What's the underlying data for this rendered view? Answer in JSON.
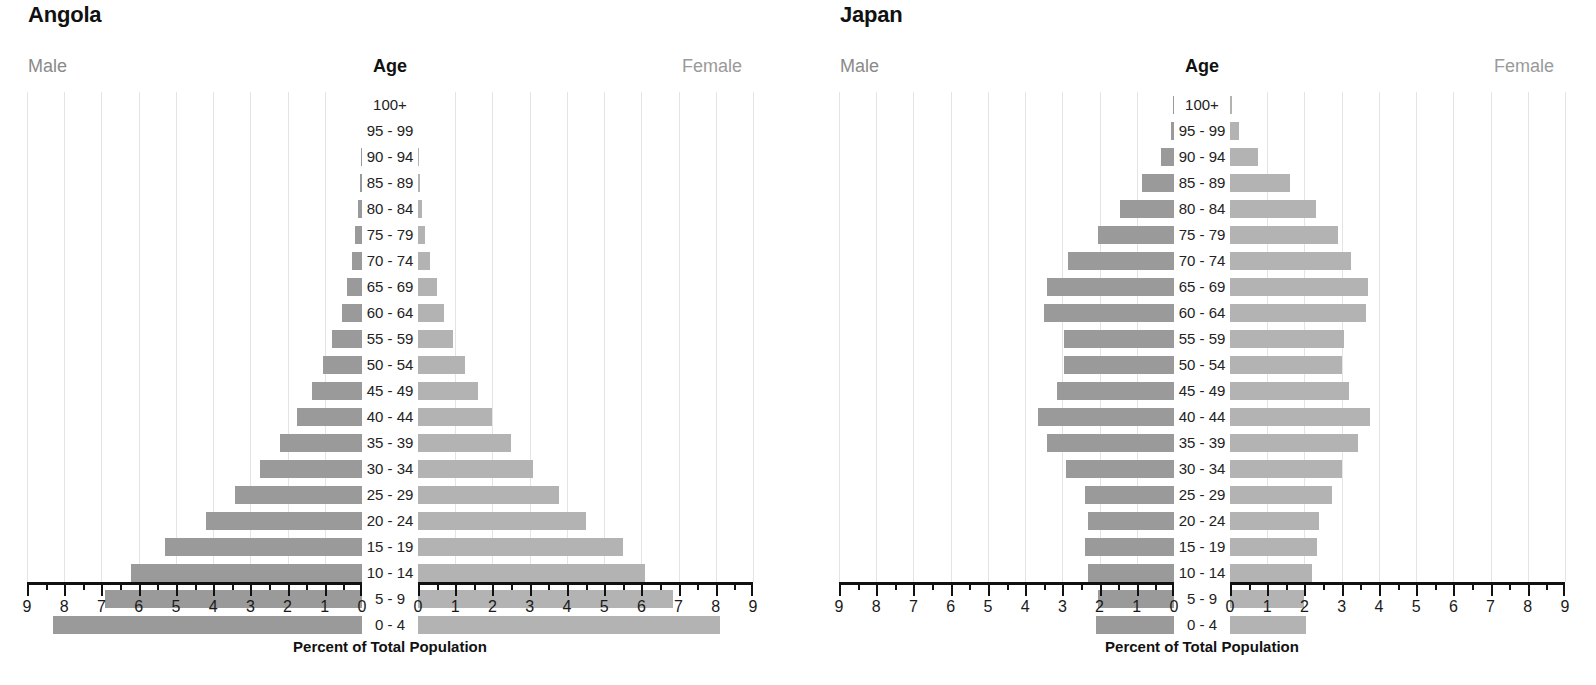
{
  "figure": {
    "axis_caption": "Percent of Total Population",
    "male_label": "Male",
    "female_label": "Female",
    "age_header": "Age",
    "bar_color_male": "#9a9a9a",
    "bar_color_female": "#b3b3b3",
    "gridline_color": "#e4e4e4",
    "axis_color": "#111111"
  },
  "age_groups": [
    "100+",
    "95 - 99",
    "90 - 94",
    "85 - 89",
    "80 - 84",
    "75 - 79",
    "70 - 74",
    "65 - 69",
    "60 - 64",
    "55 - 59",
    "50 - 54",
    "45 - 49",
    "40 - 44",
    "35 - 39",
    "30 - 34",
    "25 - 29",
    "20 - 24",
    "15 - 19",
    "10 - 14",
    "5 - 9",
    "0 - 4"
  ],
  "axis_ticks_left": [
    "9",
    "8",
    "7",
    "6",
    "5",
    "4",
    "3",
    "2",
    "1",
    "0"
  ],
  "axis_ticks_right": [
    "0",
    "1",
    "2",
    "3",
    "4",
    "5",
    "6",
    "7",
    "8",
    "9"
  ],
  "chart_data": [
    {
      "type": "bar",
      "title": "Angola",
      "subtype": "population-pyramid",
      "xlabel": "Percent of Total Population",
      "ylabel": "Age",
      "xlim": [
        0,
        9
      ],
      "grid": true,
      "legend_position": "top",
      "categories": [
        "100+",
        "95 - 99",
        "90 - 94",
        "85 - 89",
        "80 - 84",
        "75 - 79",
        "70 - 74",
        "65 - 69",
        "60 - 64",
        "55 - 59",
        "50 - 54",
        "45 - 49",
        "40 - 44",
        "35 - 39",
        "30 - 34",
        "25 - 29",
        "20 - 24",
        "15 - 19",
        "10 - 14",
        "5 - 9",
        "0 - 4"
      ],
      "series": [
        {
          "name": "Male",
          "values": [
            0.0,
            0.0,
            0.02,
            0.05,
            0.1,
            0.18,
            0.28,
            0.4,
            0.55,
            0.8,
            1.05,
            1.35,
            1.75,
            2.2,
            2.75,
            3.4,
            4.2,
            5.3,
            6.2,
            6.9,
            8.3
          ]
        },
        {
          "name": "Female",
          "values": [
            0.0,
            0.0,
            0.02,
            0.05,
            0.12,
            0.2,
            0.32,
            0.5,
            0.7,
            0.95,
            1.25,
            1.6,
            2.0,
            2.5,
            3.1,
            3.8,
            4.5,
            5.5,
            6.1,
            6.85,
            8.1
          ]
        }
      ]
    },
    {
      "type": "bar",
      "title": "Japan",
      "subtype": "population-pyramid",
      "xlabel": "Percent of Total Population",
      "ylabel": "Age",
      "xlim": [
        0,
        9
      ],
      "grid": true,
      "legend_position": "top",
      "categories": [
        "100+",
        "95 - 99",
        "90 - 94",
        "85 - 89",
        "80 - 84",
        "75 - 79",
        "70 - 74",
        "65 - 69",
        "60 - 64",
        "55 - 59",
        "50 - 54",
        "45 - 49",
        "40 - 44",
        "35 - 39",
        "30 - 34",
        "25 - 29",
        "20 - 24",
        "15 - 19",
        "10 - 14",
        "5 - 9",
        "0 - 4"
      ],
      "series": [
        {
          "name": "Male",
          "values": [
            0.02,
            0.08,
            0.35,
            0.85,
            1.45,
            2.05,
            2.85,
            3.4,
            3.5,
            2.95,
            2.95,
            3.15,
            3.65,
            3.4,
            2.9,
            2.4,
            2.3,
            2.4,
            2.3,
            2.05,
            2.1
          ]
        },
        {
          "name": "Female",
          "values": [
            0.06,
            0.25,
            0.75,
            1.6,
            2.3,
            2.9,
            3.25,
            3.7,
            3.65,
            3.05,
            3.0,
            3.2,
            3.75,
            3.45,
            3.0,
            2.75,
            2.4,
            2.35,
            2.2,
            2.0,
            2.05
          ]
        }
      ]
    }
  ]
}
